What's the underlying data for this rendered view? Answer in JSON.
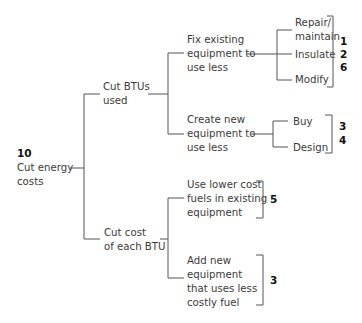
{
  "colors": {
    "line": "#555555",
    "text": "#3a3a3a",
    "number": "#111111",
    "background": "#ffffff"
  },
  "root": {
    "number": "10",
    "label_line1": "Cut energy",
    "label_line2": "costs"
  },
  "branches": [
    {
      "label_line1": "Cut BTUs",
      "label_line2": "used",
      "children": [
        {
          "label_line1": "Fix existing",
          "label_line2": "equipment to",
          "label_line3": "use less",
          "options": [
            {
              "label_line1": "Repair/",
              "label_line2": "maintain"
            },
            {
              "label_line1": "Insulate"
            },
            {
              "label_line1": "Modify"
            }
          ],
          "numbers": [
            "1",
            "2",
            "6"
          ]
        },
        {
          "label_line1": "Create new",
          "label_line2": "equipment to",
          "label_line3": "use less",
          "options": [
            {
              "label_line1": "Buy"
            },
            {
              "label_line1": "Design"
            }
          ],
          "numbers": [
            "3",
            "4"
          ]
        }
      ]
    },
    {
      "label_line1": "Cut cost",
      "label_line2": "of each BTU",
      "children": [
        {
          "label_line1": "Use lower cost",
          "label_line2": "fuels in existing",
          "label_line3": "equipment",
          "numbers": [
            "5"
          ]
        },
        {
          "label_line1": "Add new",
          "label_line2": "equipment",
          "label_line3": "that uses less",
          "label_line4": "costly fuel",
          "numbers": [
            "3"
          ]
        }
      ]
    }
  ]
}
